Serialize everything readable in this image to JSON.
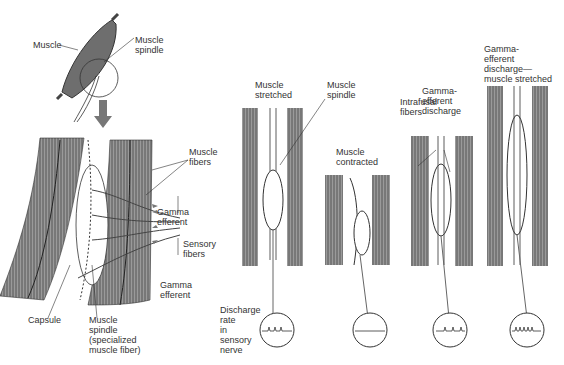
{
  "colors": {
    "muscle": "#8a8a8a",
    "band_dark": "#555555",
    "band_light": "#b5b5b5",
    "line": "#333333",
    "arrow": "#777777"
  },
  "left_panel": {
    "top_labels": {
      "muscle": "Muscle",
      "muscle_spindle": "Muscle\nspindle"
    },
    "detail_labels": {
      "muscle_fibers": "Muscle\nfibers",
      "gamma_efferent_top": "Gamma\nefferent",
      "sensory_fibers": "Sensory\nfibers",
      "gamma_efferent_bottom": "Gamma\nefferent",
      "capsule": "Capsule",
      "muscle_spindle_detail": "Muscle\nspindle\n(specialized\nmuscle fiber)"
    }
  },
  "right_panel": {
    "states": [
      {
        "label": "Muscle\nstretched",
        "extra_label": "Muscle\nspindle",
        "discharge": "moderate"
      },
      {
        "label": "Muscle\ncontracted",
        "discharge": "none"
      },
      {
        "label": "Intrafusal\nfibers",
        "extra_label": "Gamma-\nefferent\ndischarge",
        "discharge": "low"
      },
      {
        "label": "Gamma-\nefferent\ndischarge—\nmuscle stretched",
        "discharge": "high"
      }
    ],
    "discharge_label": "Discharge\nrate\nin\nsensory\nnerve"
  }
}
